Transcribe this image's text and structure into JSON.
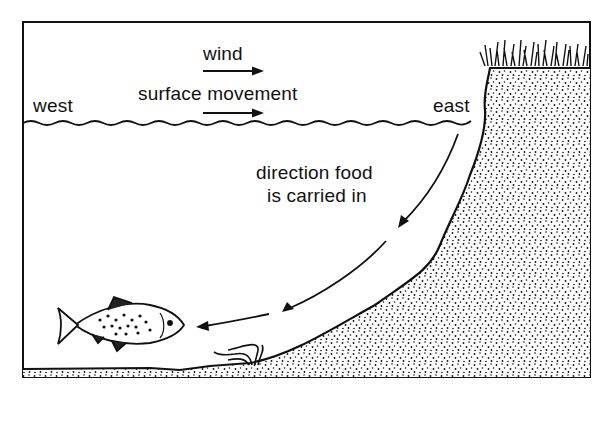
{
  "diagram": {
    "type": "cross-section",
    "labels": {
      "wind": "wind",
      "surface_movement": "surface movement",
      "west": "west",
      "east": "east",
      "food_direction_line1": "direction food",
      "food_direction_line2": "is carried in"
    },
    "elements": [
      {
        "name": "water-surface",
        "description": "wavy line across the lake"
      },
      {
        "name": "wind-arrow",
        "direction": "east"
      },
      {
        "name": "surface-movement-arrow",
        "direction": "east"
      },
      {
        "name": "bank",
        "side": "east",
        "fill": "stippled"
      },
      {
        "name": "lake-bed",
        "fill": "stippled"
      },
      {
        "name": "grass",
        "position": "top of east bank"
      },
      {
        "name": "fish",
        "position": "near lake bottom, west"
      },
      {
        "name": "weed",
        "position": "on lake bed"
      },
      {
        "name": "food-direction-arrows",
        "path": "from east surface down along bank to fish"
      }
    ],
    "colors": {
      "ink": "#111111",
      "background": "#ffffff"
    }
  }
}
